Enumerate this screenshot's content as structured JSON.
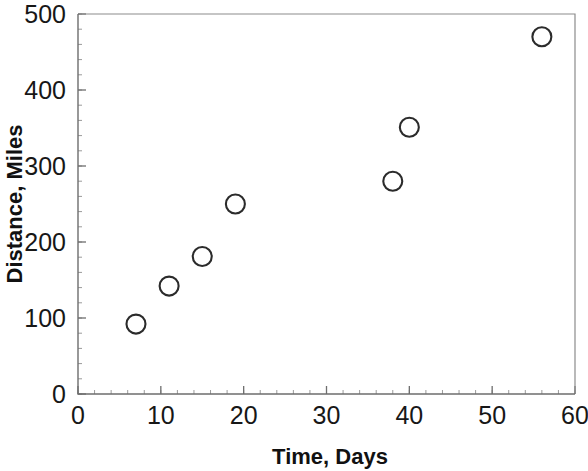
{
  "chart_data": {
    "type": "scatter",
    "title": "",
    "xlabel": "Time, Days",
    "ylabel": "Distance, Miles",
    "xlim": [
      0,
      60
    ],
    "ylim": [
      0,
      500
    ],
    "x_ticks": [
      0,
      10,
      20,
      30,
      40,
      50,
      60
    ],
    "y_ticks": [
      0,
      100,
      200,
      300,
      400,
      500
    ],
    "x_tick_labels": [
      "0",
      "10",
      "20",
      "30",
      "40",
      "50",
      "60"
    ],
    "y_tick_labels": [
      "0",
      "100",
      "200",
      "300",
      "400",
      "500"
    ],
    "x_minor_step": 2,
    "y_minor_step": 20,
    "grid": false,
    "legend": null,
    "marker": "open-circle",
    "marker_color": "#2b2b2b",
    "series": [
      {
        "name": "Distance vs Time",
        "points": [
          {
            "x": 7,
            "y": 92
          },
          {
            "x": 11,
            "y": 142
          },
          {
            "x": 15,
            "y": 181
          },
          {
            "x": 19,
            "y": 250
          },
          {
            "x": 38,
            "y": 280
          },
          {
            "x": 40,
            "y": 351
          },
          {
            "x": 56,
            "y": 470
          }
        ]
      }
    ]
  },
  "axes": {
    "frame_color": "#8c8c8c",
    "axis_color": "#6e6e6e"
  }
}
